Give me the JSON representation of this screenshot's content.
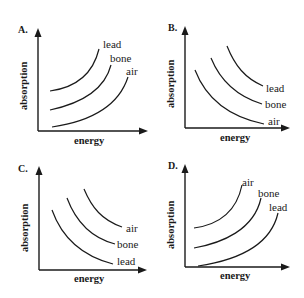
{
  "figure": {
    "panels": [
      {
        "id": "A",
        "label": "A.",
        "xlabel": "energy",
        "ylabel": "absorption",
        "trend": "increasing",
        "curves": [
          {
            "name": "lead",
            "label": "lead"
          },
          {
            "name": "bone",
            "label": "bone"
          },
          {
            "name": "air",
            "label": "air"
          }
        ]
      },
      {
        "id": "B",
        "label": "B.",
        "xlabel": "energy",
        "ylabel": "absorption",
        "trend": "decreasing",
        "curves": [
          {
            "name": "lead",
            "label": "lead"
          },
          {
            "name": "bone",
            "label": "bone"
          },
          {
            "name": "air",
            "label": "air"
          }
        ]
      },
      {
        "id": "C",
        "label": "C.",
        "xlabel": "energy",
        "ylabel": "absorption",
        "trend": "decreasing",
        "curves": [
          {
            "name": "air",
            "label": "air"
          },
          {
            "name": "bone",
            "label": "bone"
          },
          {
            "name": "lead",
            "label": "lead"
          }
        ]
      },
      {
        "id": "D",
        "label": "D.",
        "xlabel": "energy",
        "ylabel": "absorption",
        "trend": "increasing",
        "curves": [
          {
            "name": "air",
            "label": "air"
          },
          {
            "name": "bone",
            "label": "bone"
          },
          {
            "name": "lead",
            "label": "lead"
          }
        ]
      }
    ]
  }
}
